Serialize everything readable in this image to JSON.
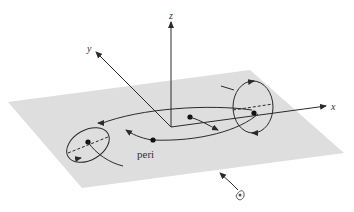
{
  "diagram": {
    "axes": {
      "x_label": "x",
      "y_label": "y",
      "z_label": "z"
    },
    "annotations": {
      "pericenter_label": "peri"
    },
    "colors": {
      "plane": "#dedede",
      "ink": "#2a2a2a"
    }
  }
}
